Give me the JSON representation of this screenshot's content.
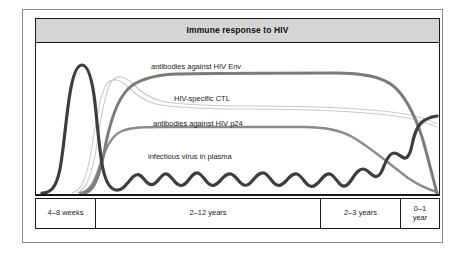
{
  "figure": {
    "title": "Immune response to HIV",
    "curve_labels": {
      "env": "antibodies against HIV Env",
      "ctl": "HIV-specific CTL",
      "p24": "antibodies against HIV p24",
      "virus": "infectious virus in plasma"
    },
    "axis_segments": [
      {
        "label": "4–8 weeks"
      },
      {
        "label": "2–12 years"
      },
      {
        "label": "2–3 years"
      },
      {
        "label": "0–1\nyear"
      }
    ],
    "colors": {
      "virus_line": "#3d3d3d",
      "env_line": "#7b7b7b",
      "p24_line": "#8a8a8a",
      "ctl_line": "#c2c2c2",
      "title_band": "#d5d5d5",
      "frame": "#1a1a1a",
      "outer_frame": "#8c8c8c"
    }
  },
  "chart_data": {
    "type": "line",
    "title": "Immune response to HIV",
    "xlabel": "",
    "ylabel": "",
    "grid": false,
    "legend": "inline-labels",
    "x_axis_segments": [
      "4–8 weeks",
      "2–12 years",
      "2–3 years",
      "0–1 year"
    ],
    "x_segment_boundaries_pct": [
      0,
      15,
      70,
      90,
      100
    ],
    "series": [
      {
        "name": "infectious virus in plasma",
        "color": "#3d3d3d",
        "style": "thick wavy",
        "description": "Sharp high acute peak during 4–8 weeks, falls to a low oscillating plateau through 2–12 years, then rises steeply during 2–3 years to a high level in the final 0–1 year.",
        "points": [
          {
            "x": 0,
            "y": 2
          },
          {
            "x": 8,
            "y": 4
          },
          {
            "x": 10,
            "y": 88
          },
          {
            "x": 12,
            "y": 92
          },
          {
            "x": 14,
            "y": 60
          },
          {
            "x": 16,
            "y": 14
          },
          {
            "x": 20,
            "y": 9
          },
          {
            "x": 30,
            "y": 11
          },
          {
            "x": 40,
            "y": 9
          },
          {
            "x": 50,
            "y": 11
          },
          {
            "x": 60,
            "y": 9
          },
          {
            "x": 70,
            "y": 12
          },
          {
            "x": 78,
            "y": 22
          },
          {
            "x": 85,
            "y": 40
          },
          {
            "x": 92,
            "y": 62
          },
          {
            "x": 97,
            "y": 74
          },
          {
            "x": 100,
            "y": 76
          }
        ]
      },
      {
        "name": "antibodies against HIV Env",
        "color": "#7b7b7b",
        "style": "thick smooth",
        "description": "Rises sharply after the acute phase to a high sustained plateau through the long asymptomatic period, then declines steeply to zero in the final year.",
        "points": [
          {
            "x": 0,
            "y": 0
          },
          {
            "x": 11,
            "y": 2
          },
          {
            "x": 15,
            "y": 55
          },
          {
            "x": 18,
            "y": 78
          },
          {
            "x": 24,
            "y": 82
          },
          {
            "x": 40,
            "y": 83
          },
          {
            "x": 70,
            "y": 83
          },
          {
            "x": 82,
            "y": 81
          },
          {
            "x": 88,
            "y": 74
          },
          {
            "x": 94,
            "y": 52
          },
          {
            "x": 100,
            "y": 4
          }
        ]
      },
      {
        "name": "HIV-specific CTL",
        "color": "#c2c2c2",
        "style": "thin double line",
        "description": "Rises during the acute phase to a peak then settles to a slowly declining moderate plateau, persisting to the end.",
        "points": [
          {
            "x": 0,
            "y": 0
          },
          {
            "x": 9,
            "y": 4
          },
          {
            "x": 13,
            "y": 45
          },
          {
            "x": 17,
            "y": 66
          },
          {
            "x": 21,
            "y": 68
          },
          {
            "x": 27,
            "y": 60
          },
          {
            "x": 35,
            "y": 55
          },
          {
            "x": 55,
            "y": 54
          },
          {
            "x": 75,
            "y": 53
          },
          {
            "x": 90,
            "y": 50
          },
          {
            "x": 100,
            "y": 45
          }
        ]
      },
      {
        "name": "antibodies against HIV p24",
        "color": "#8a8a8a",
        "style": "medium smooth",
        "description": "Rises after the acute phase to a moderate plateau, maintained through the asymptomatic period, then falls to zero during the final years.",
        "points": [
          {
            "x": 0,
            "y": 0
          },
          {
            "x": 10,
            "y": 2
          },
          {
            "x": 14,
            "y": 25
          },
          {
            "x": 18,
            "y": 37
          },
          {
            "x": 24,
            "y": 40
          },
          {
            "x": 45,
            "y": 41
          },
          {
            "x": 68,
            "y": 41
          },
          {
            "x": 76,
            "y": 38
          },
          {
            "x": 85,
            "y": 27
          },
          {
            "x": 93,
            "y": 14
          },
          {
            "x": 100,
            "y": 2
          }
        ]
      }
    ]
  }
}
